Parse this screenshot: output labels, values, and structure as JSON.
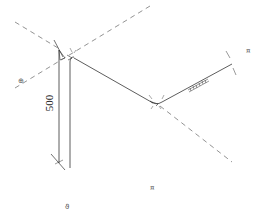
{
  "drawing": {
    "type": "isometric-pipe-drawing",
    "background": "#ffffff",
    "line_color": "#333333",
    "dash_color": "#666666",
    "dimension": {
      "value": "500",
      "orientation": "vertical"
    },
    "markers": [
      {
        "name": "marker-left",
        "glyph": "⊕",
        "x": 18,
        "y": 78
      },
      {
        "name": "marker-right",
        "glyph": "¤",
        "x": 246,
        "y": 48
      },
      {
        "name": "marker-bottom-center",
        "glyph": "¤",
        "x": 150,
        "y": 185
      },
      {
        "name": "marker-bottom-left",
        "glyph": "ϑ",
        "x": 65,
        "y": 204
      }
    ]
  }
}
